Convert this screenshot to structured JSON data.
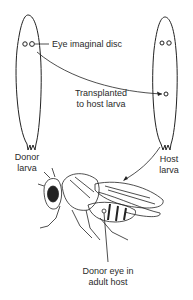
{
  "labels": {
    "eye_disc": "Eye imaginal disc",
    "transplanted_1": "Transplanted",
    "transplanted_2": "to host larva",
    "donor_1": "Donor",
    "donor_2": "larva",
    "host_1": "Host",
    "host_2": "larva",
    "donor_eye_1": "Donor eye in",
    "donor_eye_2": "adult host"
  },
  "colors": {
    "stroke": "#222222",
    "background": "#ffffff"
  }
}
